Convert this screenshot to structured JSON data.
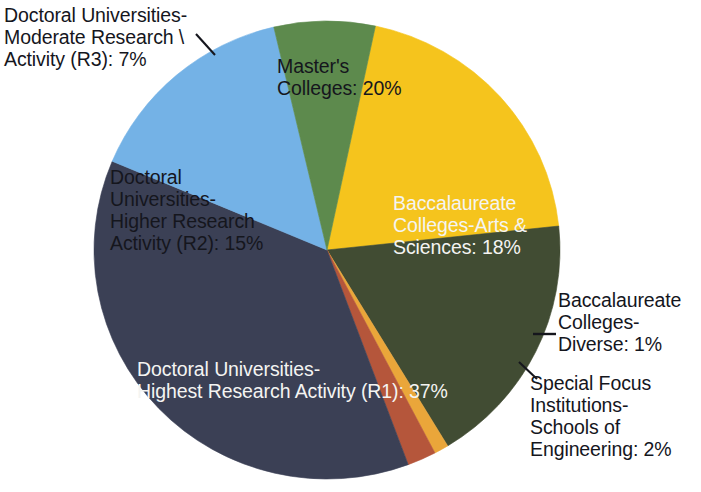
{
  "chart_data": {
    "type": "pie",
    "title": "",
    "subtitle": "",
    "xlabel": "",
    "ylabel": "",
    "legend_position": "none",
    "grid": false,
    "labels_on_slices": true,
    "units": "percent",
    "total": 100,
    "categories": [
      "Master's Colleges",
      "Baccalaureate Colleges-Arts & Sciences",
      "Baccalaureate Colleges-Diverse",
      "Special Focus Institutions-Schools of Engineering",
      "Doctoral Universities-Highest Research Activity (R1)",
      "Doctoral Universities-Higher Research Activity (R2)",
      "Doctoral Universities-Moderate Research Activity (R3)"
    ],
    "values": [
      20,
      18,
      1,
      2,
      37,
      15,
      7
    ],
    "colors": [
      "#f5c41d",
      "#414c33",
      "#eaa63a",
      "#b5563b",
      "#3b4055",
      "#74b2e6",
      "#5d8a4d"
    ],
    "slices": [
      {
        "name": "Master's Colleges",
        "value": 20,
        "value_text": "20%",
        "label_text": "Master's\nColleges: 20%",
        "color": "#f5c41d",
        "text_color": "#15161d",
        "start_angle": -78,
        "end_angle": -6
      },
      {
        "name": "Baccalaureate Colleges-Arts & Sciences",
        "value": 18,
        "value_text": "18%",
        "label_text": "Baccalaureate\nColleges-Arts &\nSciences: 18%",
        "color": "#414c33",
        "text_color": "#f4f4f2",
        "start_angle": -6,
        "end_angle": 58.8
      },
      {
        "name": "Baccalaureate Colleges-Diverse",
        "value": 1,
        "value_text": "1%",
        "label_text": "Baccalaureate\nColleges-\nDiverse: 1%",
        "color": "#eaa63a",
        "text_color": "#15161d",
        "start_angle": 58.8,
        "end_angle": 62.4
      },
      {
        "name": "Special Focus Institutions-Schools of Engineering",
        "value": 2,
        "value_text": "2%",
        "label_text": "Special Focus\nInstitutions-\nSchools of\nEngineering: 2%",
        "color": "#b5563b",
        "text_color": "#15161d",
        "start_angle": 62.4,
        "end_angle": 69.6
      },
      {
        "name": "Doctoral Universities-Highest Research Activity (R1)",
        "value": 37,
        "value_text": "37%",
        "label_text": "Doctoral Universities-\nHighest Research Activity (R1): 37%",
        "color": "#3b4055",
        "text_color": "#f4f4f2",
        "start_angle": 69.6,
        "end_angle": 202.8
      },
      {
        "name": "Doctoral Universities-Higher Research Activity (R2)",
        "value": 15,
        "value_text": "15%",
        "label_text": "Doctoral\nUniversities-\nHigher Research\nActivity (R2): 15%",
        "color": "#74b2e6",
        "text_color": "#15161d",
        "start_angle": 202.8,
        "end_angle": 256.8
      },
      {
        "name": "Doctoral Universities-Moderate Research Activity (R3)",
        "value": 7,
        "value_text": "7%",
        "label_text": "Doctoral Universities-\nModerate Research \\\nActivity (R3): 7%",
        "color": "#5d8a4d",
        "text_color": "#15161d",
        "start_angle": 256.8,
        "end_angle": 282
      }
    ]
  },
  "labels": {
    "r3": "Doctoral Universities-\nModerate Research \\\nActivity (R3): 7%",
    "masters": "Master's\nColleges: 20%",
    "bacc_arts": "Baccalaureate\nColleges-Arts &\nSciences: 18%",
    "r2": "Doctoral\nUniversities-\nHigher Research\nActivity (R2): 15%",
    "r1": "Doctoral Universities-\nHighest Research Activity (R1): 37%",
    "bacc_diverse": "Baccalaureate\nColleges-\nDiverse: 1%",
    "special_focus": "Special Focus\nInstitutions-\nSchools of\nEngineering: 2%"
  },
  "geometry": {
    "center_x": 327,
    "center_y": 250,
    "radius_x": 233,
    "radius_y": 229
  },
  "background_color": "#ffffff"
}
